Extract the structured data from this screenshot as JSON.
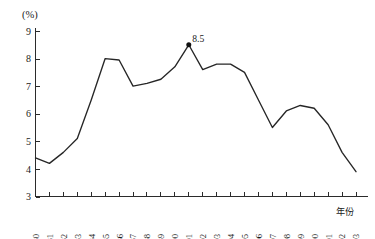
{
  "chart_data": {
    "type": "line",
    "title": "",
    "subtitle": "",
    "xlabel": "年份",
    "ylabel": "(%)",
    "unit_label": "(%)",
    "grid": false,
    "legend": "none",
    "xlim": [
      1980,
      2003
    ],
    "ylim": [
      3,
      9
    ],
    "ytick_values": [
      3,
      4,
      5,
      6,
      7,
      8,
      9
    ],
    "ytick_labels": [
      "3",
      "4",
      "5",
      "6",
      "7",
      "8",
      "9"
    ],
    "categories": [
      "1980",
      "1981",
      "1982",
      "1983",
      "1984",
      "1985",
      "1986",
      "1987",
      "1988",
      "1989",
      "1990",
      "1991",
      "1992",
      "1993",
      "1994",
      "1995",
      "1996",
      "1997",
      "1998",
      "1999",
      "2000",
      "2001",
      "2002",
      "2003"
    ],
    "values": [
      4.4,
      4.2,
      4.6,
      5.1,
      6.5,
      8.0,
      7.95,
      7.0,
      7.1,
      7.25,
      7.7,
      8.5,
      7.6,
      7.8,
      7.8,
      7.5,
      6.5,
      5.5,
      6.1,
      6.3,
      6.2,
      5.6,
      4.6,
      3.9
    ],
    "annotations": [
      {
        "category": "1991",
        "value": 8.5,
        "label": "8.5",
        "marker": "filled-circle"
      }
    ]
  },
  "axis": {
    "y_unit_text": "(%)",
    "x_title_text": "年份"
  }
}
